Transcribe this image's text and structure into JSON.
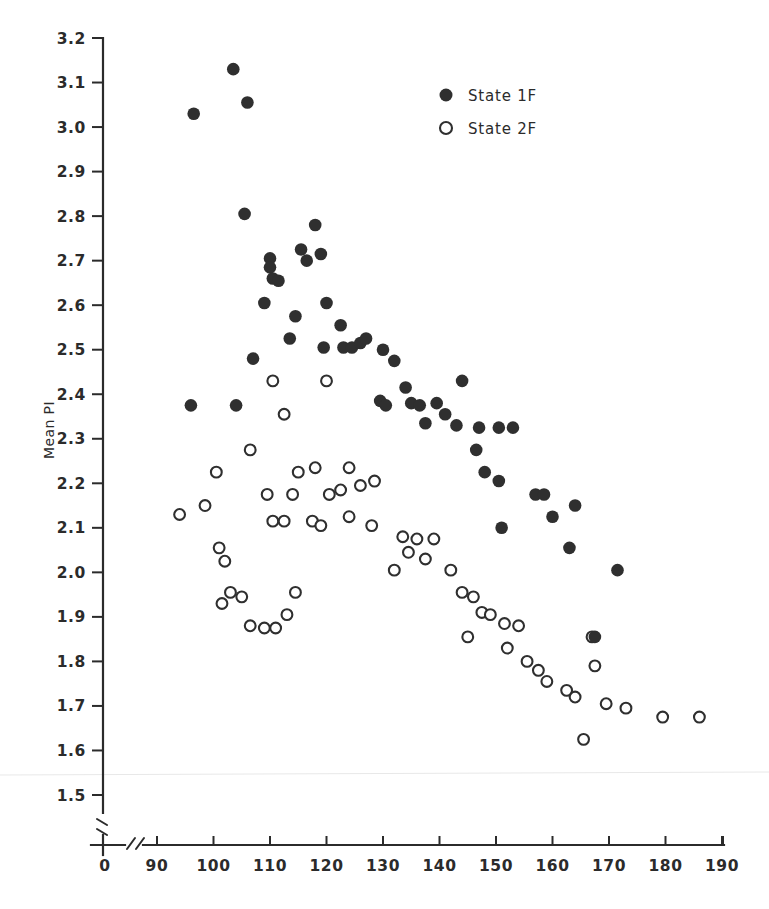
{
  "chart_data": {
    "type": "scatter",
    "title": "",
    "xlabel": "",
    "ylabel": "Mean PI",
    "xlim": [
      85,
      190
    ],
    "ylim": [
      1.5,
      3.2
    ],
    "x_ticks": [
      90,
      100,
      110,
      120,
      130,
      140,
      150,
      160,
      170,
      180,
      190
    ],
    "y_ticks": [
      1.5,
      1.6,
      1.7,
      1.8,
      1.9,
      2.0,
      2.1,
      2.2,
      2.3,
      2.4,
      2.5,
      2.6,
      2.7,
      2.8,
      2.9,
      3.0,
      3.1,
      3.2
    ],
    "x_origin_label": "0",
    "axis_break_x": true,
    "axis_break_y": true,
    "grid": false,
    "legend_position": "top-right",
    "series": [
      {
        "name": "State 1F",
        "marker": "filled-circle",
        "color": "#2f2f2f",
        "points": [
          [
            96.5,
            3.03
          ],
          [
            103.5,
            3.13
          ],
          [
            106.0,
            3.055
          ],
          [
            105.5,
            2.805
          ],
          [
            110.0,
            2.705
          ],
          [
            110.0,
            2.685
          ],
          [
            110.5,
            2.66
          ],
          [
            111.5,
            2.655
          ],
          [
            109.0,
            2.605
          ],
          [
            118.0,
            2.78
          ],
          [
            115.5,
            2.725
          ],
          [
            116.5,
            2.7
          ],
          [
            119.0,
            2.715
          ],
          [
            114.5,
            2.575
          ],
          [
            120.0,
            2.605
          ],
          [
            122.5,
            2.555
          ],
          [
            113.5,
            2.525
          ],
          [
            119.5,
            2.505
          ],
          [
            123.0,
            2.505
          ],
          [
            124.5,
            2.505
          ],
          [
            126.0,
            2.515
          ],
          [
            127.0,
            2.525
          ],
          [
            130.0,
            2.5
          ],
          [
            132.0,
            2.475
          ],
          [
            107.0,
            2.48
          ],
          [
            96.0,
            2.375
          ],
          [
            104.0,
            2.375
          ],
          [
            129.5,
            2.385
          ],
          [
            130.5,
            2.375
          ],
          [
            135.0,
            2.38
          ],
          [
            136.5,
            2.375
          ],
          [
            139.5,
            2.38
          ],
          [
            134.0,
            2.415
          ],
          [
            144.0,
            2.43
          ],
          [
            141.0,
            2.355
          ],
          [
            143.0,
            2.33
          ],
          [
            137.5,
            2.335
          ],
          [
            147.0,
            2.325
          ],
          [
            150.5,
            2.325
          ],
          [
            153.0,
            2.325
          ],
          [
            146.5,
            2.275
          ],
          [
            148.0,
            2.225
          ],
          [
            150.5,
            2.205
          ],
          [
            151.0,
            2.1
          ],
          [
            157.0,
            2.175
          ],
          [
            158.5,
            2.175
          ],
          [
            160.0,
            2.125
          ],
          [
            164.0,
            2.15
          ],
          [
            163.0,
            2.055
          ],
          [
            171.5,
            2.005
          ],
          [
            167.5,
            1.855
          ]
        ]
      },
      {
        "name": "State 2F",
        "marker": "open-circle",
        "color": "#2f2f2f",
        "points": [
          [
            94.0,
            2.13
          ],
          [
            98.5,
            2.15
          ],
          [
            100.5,
            2.225
          ],
          [
            106.5,
            2.275
          ],
          [
            110.5,
            2.43
          ],
          [
            112.5,
            2.355
          ],
          [
            120.0,
            2.43
          ],
          [
            115.0,
            2.225
          ],
          [
            118.0,
            2.235
          ],
          [
            124.0,
            2.235
          ],
          [
            109.5,
            2.175
          ],
          [
            114.0,
            2.175
          ],
          [
            120.5,
            2.175
          ],
          [
            122.5,
            2.185
          ],
          [
            126.0,
            2.195
          ],
          [
            128.5,
            2.205
          ],
          [
            110.5,
            2.115
          ],
          [
            112.5,
            2.115
          ],
          [
            117.5,
            2.115
          ],
          [
            119.0,
            2.105
          ],
          [
            124.0,
            2.125
          ],
          [
            128.0,
            2.105
          ],
          [
            101.0,
            2.055
          ],
          [
            102.0,
            2.025
          ],
          [
            103.0,
            1.955
          ],
          [
            101.5,
            1.93
          ],
          [
            105.0,
            1.945
          ],
          [
            106.5,
            1.88
          ],
          [
            109.0,
            1.875
          ],
          [
            111.0,
            1.875
          ],
          [
            113.0,
            1.905
          ],
          [
            114.5,
            1.955
          ],
          [
            133.5,
            2.08
          ],
          [
            136.0,
            2.075
          ],
          [
            139.0,
            2.075
          ],
          [
            134.5,
            2.045
          ],
          [
            137.5,
            2.03
          ],
          [
            132.0,
            2.005
          ],
          [
            142.0,
            2.005
          ],
          [
            144.0,
            1.955
          ],
          [
            146.0,
            1.945
          ],
          [
            147.5,
            1.91
          ],
          [
            149.0,
            1.905
          ],
          [
            145.0,
            1.855
          ],
          [
            151.5,
            1.885
          ],
          [
            154.0,
            1.88
          ],
          [
            152.0,
            1.83
          ],
          [
            155.5,
            1.8
          ],
          [
            157.5,
            1.78
          ],
          [
            159.0,
            1.755
          ],
          [
            167.0,
            1.855
          ],
          [
            167.5,
            1.79
          ],
          [
            162.5,
            1.735
          ],
          [
            164.0,
            1.72
          ],
          [
            169.5,
            1.705
          ],
          [
            173.0,
            1.695
          ],
          [
            165.5,
            1.625
          ],
          [
            179.5,
            1.675
          ],
          [
            186.0,
            1.675
          ]
        ]
      }
    ]
  },
  "legend": {
    "entries": [
      {
        "label": "State 1F",
        "marker": "filled-circle"
      },
      {
        "label": "State 2F",
        "marker": "open-circle"
      }
    ]
  },
  "axes": {
    "y_axis_title": "Mean PI",
    "x_zero_label": "0"
  }
}
